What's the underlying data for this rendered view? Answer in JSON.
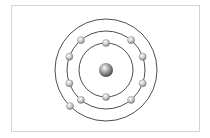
{
  "diagram": {
    "type": "bohr-atom-model",
    "center": [
      106,
      70
    ],
    "nucleus": {
      "radius": 7
    },
    "shells": [
      {
        "name": "shell-1",
        "radius": 27,
        "electrons": 2,
        "angles": [
          -90,
          90
        ]
      },
      {
        "name": "shell-2",
        "radius": 39,
        "electrons": 8,
        "angles": [
          -130,
          -50,
          -20,
          20,
          50,
          130,
          160,
          200
        ]
      },
      {
        "name": "shell-3",
        "radius": 51,
        "electrons": 1,
        "angles": [
          135
        ]
      }
    ],
    "electron_radius": 3.6,
    "colors": {
      "orbit": "#3a3a3a",
      "frame": "#d4d4d4",
      "electron_fill": "#c8c8c8",
      "nucleus_fill": "#9a9a9a"
    }
  }
}
